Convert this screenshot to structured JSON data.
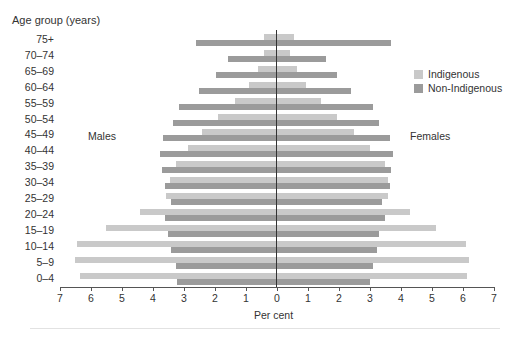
{
  "chart_data": {
    "type": "bar",
    "subtype": "population-pyramid",
    "title": "",
    "ylabel": "Age group (years)",
    "xlabel": "Per cent",
    "xlim": [
      -7,
      7
    ],
    "xticks": [
      7,
      6,
      5,
      4,
      3,
      2,
      1,
      0,
      1,
      2,
      3,
      4,
      5,
      6,
      7
    ],
    "grid": false,
    "legend_position": "right",
    "side_labels": {
      "left": "Males",
      "right": "Females"
    },
    "categories": [
      "75+",
      "70–74",
      "65–69",
      "60–64",
      "55–59",
      "50–54",
      "45–49",
      "40–44",
      "35–39",
      "30–34",
      "25–29",
      "20–24",
      "15–19",
      "10–14",
      "5–9",
      "0–4"
    ],
    "series": [
      {
        "name": "Indigenous",
        "sex": "Males",
        "color": "#c9c9c9",
        "values": [
          0.4,
          0.4,
          0.6,
          0.9,
          1.35,
          1.9,
          2.4,
          2.85,
          3.25,
          3.45,
          3.55,
          4.4,
          5.5,
          6.45,
          6.5,
          6.35
        ]
      },
      {
        "name": "Non-Indigenous",
        "sex": "Males",
        "color": "#9b9b9b",
        "values": [
          2.6,
          1.55,
          1.95,
          2.5,
          3.15,
          3.35,
          3.65,
          3.75,
          3.7,
          3.6,
          3.4,
          3.6,
          3.5,
          3.4,
          3.25,
          3.2
        ]
      },
      {
        "name": "Indigenous",
        "sex": "Females",
        "color": "#c9c9c9",
        "values": [
          0.55,
          0.45,
          0.65,
          0.95,
          1.45,
          1.95,
          2.5,
          3.0,
          3.5,
          3.6,
          3.6,
          4.3,
          5.15,
          6.1,
          6.2,
          6.15
        ]
      },
      {
        "name": "Non-Indigenous",
        "sex": "Females",
        "color": "#9b9b9b",
        "values": [
          3.7,
          1.6,
          1.95,
          2.4,
          3.1,
          3.3,
          3.65,
          3.75,
          3.7,
          3.65,
          3.4,
          3.5,
          3.3,
          3.25,
          3.1,
          3.0
        ]
      }
    ]
  },
  "labels": {
    "y_title": "Age group (years)",
    "x_title": "Per cent",
    "males": "Males",
    "females": "Females",
    "legend_indigenous": "Indigenous",
    "legend_non_indigenous": "Non-Indigenous"
  },
  "colors": {
    "indigenous": "#c9c9c9",
    "non_indigenous": "#9b9b9b"
  }
}
